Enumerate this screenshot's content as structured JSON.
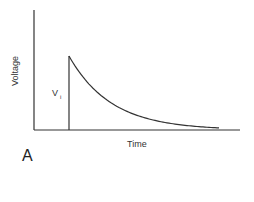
{
  "chart_data": {
    "type": "line",
    "title": "",
    "panel_label": "A",
    "xlabel": "Time",
    "ylabel": "Voltage",
    "grid": false,
    "legend": null,
    "annotations": [
      {
        "text": "V",
        "subscript": "i",
        "position": "left of vertical step"
      }
    ],
    "series": [
      {
        "name": "voltage decay",
        "description": "zero until step, instantaneous rise to V_i, then exponential decay toward zero",
        "x": [
          0,
          0.19,
          0.19,
          0.3,
          0.4,
          0.5,
          0.6,
          0.7,
          0.8,
          0.9,
          0.97
        ],
        "y": [
          0,
          0,
          1.0,
          0.68,
          0.47,
          0.32,
          0.2,
          0.12,
          0.06,
          0.02,
          0.0
        ]
      }
    ],
    "xlim": [
      0,
      1
    ],
    "ylim": [
      0,
      1.6
    ]
  },
  "labels": {
    "ylabel": "Voltage",
    "xlabel": "Time",
    "vi_main": "V",
    "vi_sub": "i",
    "panel": "A"
  },
  "colors": {
    "line": "#333333",
    "axis": "#333333"
  }
}
